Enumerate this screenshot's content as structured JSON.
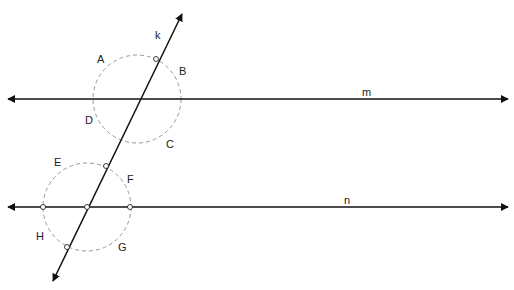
{
  "diagram": {
    "type": "geometry-construction",
    "colors": {
      "line": "#111111",
      "circle": "#999999",
      "point_fill": "#ffffff"
    },
    "lines": [
      {
        "name": "m",
        "label": "m",
        "y": 99
      },
      {
        "name": "n",
        "label": "n",
        "y": 207
      },
      {
        "name": "k",
        "label": "k"
      }
    ],
    "circles": [
      {
        "name": "upper-circle",
        "cx": 137,
        "cy": 99,
        "r": 44
      },
      {
        "name": "lower-circle",
        "cx": 87,
        "cy": 207,
        "r": 44
      }
    ],
    "angle_labels": {
      "A": "A",
      "B": "B",
      "C": "C",
      "D": "D",
      "E": "E",
      "F": "F",
      "G": "G",
      "H": "H"
    },
    "line_labels": {
      "k": "k",
      "m": "m",
      "n": "n"
    }
  }
}
